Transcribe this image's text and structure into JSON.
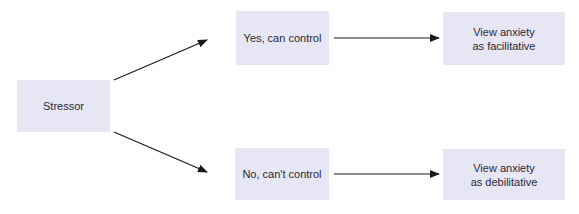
{
  "diagram": {
    "nodes": {
      "stressor": {
        "label": "Stressor"
      },
      "can_control": {
        "label": "Yes, can control"
      },
      "cannot_control": {
        "label": "No, can't control"
      },
      "facilitative": {
        "line1": "View anxiety",
        "line2": "as facilitative"
      },
      "debilitative": {
        "line1": "View anxiety",
        "line2": "as debilitative"
      }
    },
    "edges": [
      {
        "from": "Stressor",
        "to": "Yes, can control"
      },
      {
        "from": "Stressor",
        "to": "No, can't control"
      },
      {
        "from": "Yes, can control",
        "to": "View anxiety as facilitative"
      },
      {
        "from": "No, can't control",
        "to": "View anxiety as debilitative"
      }
    ],
    "colors": {
      "box_fill": "#e6e6f5",
      "arrow": "#1a1a1a",
      "text": "#2a2a33"
    }
  }
}
